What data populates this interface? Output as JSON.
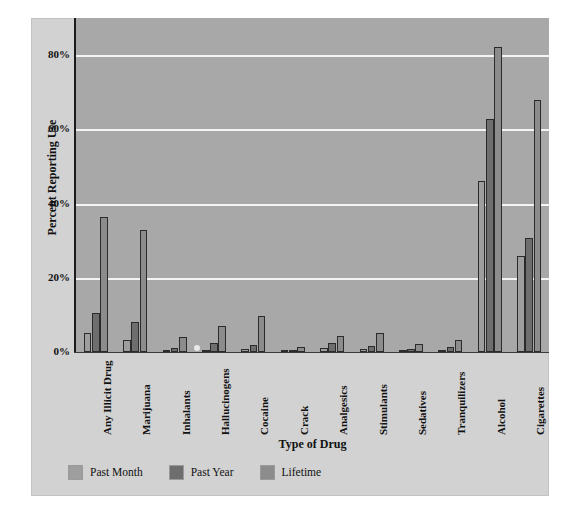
{
  "chart_data": {
    "type": "bar",
    "title": "",
    "xlabel": "Type of Drug",
    "ylabel": "Percent Reporting Use",
    "ylim": [
      0,
      90
    ],
    "ytick_values": [
      0,
      20,
      40,
      60,
      80
    ],
    "ytick_labels": [
      "0%",
      "20%",
      "40%",
      "60%",
      "80%"
    ],
    "grid": true,
    "legend_position": "below-axes-left",
    "categories": [
      "Any Illicit Drug",
      "Marijuana",
      "Inhalants",
      "Hallucinogens",
      "Cocaine",
      "Crack",
      "Analgesics",
      "Stimulants",
      "Sedatives",
      "Tranquilizers",
      "Alcohol",
      "Cigarettes"
    ],
    "series": [
      {
        "name": "Past Month",
        "color": "#9e9e9e",
        "values": [
          5.0,
          3.3,
          0.4,
          0.6,
          0.9,
          0.2,
          1.0,
          0.7,
          0.3,
          0.5,
          46.0,
          25.9
        ]
      },
      {
        "name": "Past Year",
        "color": "#6e6e6e",
        "values": [
          10.5,
          8.0,
          1.2,
          2.4,
          2.0,
          0.5,
          2.3,
          1.6,
          0.7,
          1.3,
          62.8,
          30.8
        ]
      },
      {
        "name": "Lifetime",
        "color": "#8c8c8c",
        "values": [
          36.5,
          32.8,
          4.1,
          7.0,
          9.8,
          1.4,
          4.2,
          5.0,
          2.2,
          3.2,
          82.2,
          68.0
        ]
      }
    ]
  },
  "axes": {
    "ylabel": "Percent Reporting Use",
    "xlabel": "Type of Drug"
  },
  "legend": {
    "items": [
      {
        "label": "Past Month",
        "color": "#9e9e9e"
      },
      {
        "label": "Past Year",
        "color": "#6e6e6e"
      },
      {
        "label": "Lifetime",
        "color": "#8c8c8c"
      }
    ]
  },
  "colors": {
    "panel_background": "#a8a8a8",
    "card_background": "#d2d2d2",
    "gridline": "#f4f4f4",
    "axis": "#1a1a1a",
    "bar_edge": "#2b2b2b"
  }
}
